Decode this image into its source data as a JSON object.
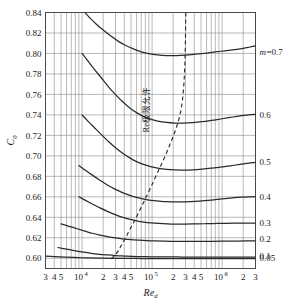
{
  "chart_data": {
    "type": "line",
    "title": "",
    "xlabel": "Re_d",
    "ylabel": "C_0",
    "xscale": "log",
    "xlim": [
      3000,
      3000000
    ],
    "ylim": [
      0.59,
      0.84
    ],
    "grid": true,
    "legend_position": "right-outside",
    "y_ticks": [
      0.6,
      0.62,
      0.64,
      0.66,
      0.68,
      0.7,
      0.72,
      0.74,
      0.76,
      0.78,
      0.8,
      0.82,
      0.84
    ],
    "y_tick_labels": [
      "0.60",
      "0.62",
      "0.64",
      "0.66",
      "0.68",
      "0.70",
      "0.72",
      "0.74",
      "0.76",
      "0.78",
      "0.80",
      "0.82",
      "0.84"
    ],
    "x_major_ticks": [
      10000,
      100000,
      1000000
    ],
    "x_major_tick_labels": [
      "10",
      "10",
      "10"
    ],
    "x_major_tick_exponents": [
      "4",
      "5",
      "6"
    ],
    "x_minor_ticks": [
      3000,
      4000,
      5000,
      20000,
      30000,
      40000,
      50000,
      200000,
      300000,
      400000,
      500000,
      2000000,
      3000000
    ],
    "x_minor_tick_labels": [
      "3",
      "4",
      "5",
      "2",
      "3",
      "4",
      "5",
      "2",
      "3",
      "4",
      "5",
      "2",
      "3"
    ],
    "legend_title": "m=0.7",
    "legend_entries": [
      "m=0.7",
      "0.6",
      "0.5",
      "0.4",
      "0.3",
      "0.2",
      "0.1",
      "0.05"
    ],
    "annotations": [
      {
        "text": "Re极限允许",
        "x": 90000,
        "y": 0.745,
        "rotation": -90
      }
    ],
    "series": [
      {
        "name": "m=0.7",
        "label": "m=0.7",
        "style": "solid",
        "label_value": 0.801,
        "points": [
          [
            11000,
            0.84
          ],
          [
            13000,
            0.8345
          ],
          [
            16000,
            0.8285
          ],
          [
            20000,
            0.8228
          ],
          [
            26000,
            0.8168
          ],
          [
            33000,
            0.8118
          ],
          [
            42000,
            0.8078
          ],
          [
            55000,
            0.8042
          ],
          [
            70000,
            0.8016
          ],
          [
            90000,
            0.7998
          ],
          [
            120000,
            0.7986
          ],
          [
            160000,
            0.798
          ],
          [
            220000,
            0.798
          ],
          [
            300000,
            0.7984
          ],
          [
            420000,
            0.7993
          ],
          [
            600000,
            0.8004
          ],
          [
            800000,
            0.8015
          ],
          [
            1100000,
            0.8026
          ],
          [
            1500000,
            0.8038
          ],
          [
            2000000,
            0.805
          ],
          [
            2500000,
            0.8063
          ],
          [
            3000000,
            0.8074
          ]
        ]
      },
      {
        "name": "m=0.6",
        "label": "0.6",
        "style": "solid",
        "label_value": 0.74,
        "points": [
          [
            10000,
            0.8
          ],
          [
            12000,
            0.793
          ],
          [
            15000,
            0.7845
          ],
          [
            19000,
            0.7758
          ],
          [
            24000,
            0.7672
          ],
          [
            30000,
            0.7598
          ],
          [
            38000,
            0.7528
          ],
          [
            48000,
            0.7468
          ],
          [
            60000,
            0.7422
          ],
          [
            75000,
            0.7386
          ],
          [
            95000,
            0.7358
          ],
          [
            120000,
            0.734
          ],
          [
            160000,
            0.7326
          ],
          [
            210000,
            0.732
          ],
          [
            280000,
            0.732
          ],
          [
            380000,
            0.7325
          ],
          [
            520000,
            0.7334
          ],
          [
            700000,
            0.7346
          ],
          [
            950000,
            0.736
          ],
          [
            1300000,
            0.7375
          ],
          [
            1800000,
            0.739
          ],
          [
            2400000,
            0.74
          ],
          [
            3000000,
            0.7406
          ]
        ]
      },
      {
        "name": "m=0.5",
        "label": "0.5",
        "style": "solid",
        "label_value": 0.694,
        "points": [
          [
            10000,
            0.74
          ],
          [
            12000,
            0.7342
          ],
          [
            15000,
            0.7275
          ],
          [
            19000,
            0.7205
          ],
          [
            24000,
            0.7138
          ],
          [
            30000,
            0.708
          ],
          [
            38000,
            0.7026
          ],
          [
            48000,
            0.698
          ],
          [
            60000,
            0.6944
          ],
          [
            75000,
            0.6916
          ],
          [
            95000,
            0.6895
          ],
          [
            120000,
            0.688
          ],
          [
            160000,
            0.6868
          ],
          [
            210000,
            0.6862
          ],
          [
            280000,
            0.6861
          ],
          [
            380000,
            0.6864
          ],
          [
            520000,
            0.6871
          ],
          [
            700000,
            0.688
          ],
          [
            950000,
            0.6891
          ],
          [
            1300000,
            0.6903
          ],
          [
            1800000,
            0.6916
          ],
          [
            2400000,
            0.6928
          ],
          [
            3000000,
            0.6936
          ]
        ]
      },
      {
        "name": "m=0.4",
        "label": "0.4",
        "style": "solid",
        "label_value": 0.66,
        "points": [
          [
            9000,
            0.6905
          ],
          [
            11000,
            0.6862
          ],
          [
            14000,
            0.6812
          ],
          [
            18000,
            0.6762
          ],
          [
            23000,
            0.6716
          ],
          [
            29000,
            0.6678
          ],
          [
            37000,
            0.6644
          ],
          [
            47000,
            0.6616
          ],
          [
            60000,
            0.6594
          ],
          [
            76000,
            0.6578
          ],
          [
            96000,
            0.6566
          ],
          [
            125000,
            0.6558
          ],
          [
            165000,
            0.6552
          ],
          [
            220000,
            0.655
          ],
          [
            300000,
            0.6551
          ],
          [
            410000,
            0.6555
          ],
          [
            560000,
            0.6562
          ],
          [
            760000,
            0.6571
          ],
          [
            1000000,
            0.658
          ],
          [
            1400000,
            0.6589
          ],
          [
            1900000,
            0.6596
          ],
          [
            2500000,
            0.66
          ],
          [
            3000000,
            0.6602
          ]
        ]
      },
      {
        "name": "m=0.3",
        "label": "0.3",
        "style": "solid",
        "label_value": 0.634,
        "points": [
          [
            9000,
            0.66
          ],
          [
            11000,
            0.6568
          ],
          [
            14000,
            0.653
          ],
          [
            18000,
            0.6492
          ],
          [
            23000,
            0.6458
          ],
          [
            29000,
            0.6428
          ],
          [
            37000,
            0.6402
          ],
          [
            47000,
            0.6382
          ],
          [
            60000,
            0.6366
          ],
          [
            76000,
            0.6354
          ],
          [
            96000,
            0.6346
          ],
          [
            125000,
            0.634
          ],
          [
            165000,
            0.6336
          ],
          [
            220000,
            0.6334
          ],
          [
            300000,
            0.6334
          ],
          [
            410000,
            0.6335
          ],
          [
            560000,
            0.6337
          ],
          [
            760000,
            0.6339
          ],
          [
            1000000,
            0.6341
          ],
          [
            1400000,
            0.6342
          ],
          [
            1900000,
            0.6343
          ],
          [
            2500000,
            0.6344
          ],
          [
            3000000,
            0.6344
          ]
        ]
      },
      {
        "name": "m=0.2",
        "label": "0.2",
        "style": "solid",
        "label_value": 0.619,
        "points": [
          [
            5000,
            0.6335
          ],
          [
            6500,
            0.6312
          ],
          [
            8500,
            0.6288
          ],
          [
            11000,
            0.6265
          ],
          [
            14000,
            0.6244
          ],
          [
            18000,
            0.6226
          ],
          [
            23000,
            0.6211
          ],
          [
            30000,
            0.6198
          ],
          [
            39000,
            0.6188
          ],
          [
            50000,
            0.6181
          ],
          [
            65000,
            0.6176
          ],
          [
            85000,
            0.6172
          ],
          [
            110000,
            0.6169
          ],
          [
            145000,
            0.6167
          ],
          [
            195000,
            0.6166
          ],
          [
            265000,
            0.6165
          ],
          [
            360000,
            0.6165
          ],
          [
            500000,
            0.6165
          ],
          [
            700000,
            0.6166
          ],
          [
            1000000,
            0.6167
          ],
          [
            1500000,
            0.6168
          ],
          [
            2200000,
            0.6169
          ],
          [
            3000000,
            0.617
          ]
        ]
      },
      {
        "name": "m=0.1",
        "label": "0.1",
        "style": "solid",
        "label_value": 0.602,
        "points": [
          [
            4500,
            0.6105
          ],
          [
            6000,
            0.6089
          ],
          [
            8000,
            0.6073
          ],
          [
            10500,
            0.6059
          ],
          [
            13500,
            0.6048
          ],
          [
            17500,
            0.6039
          ],
          [
            23000,
            0.6032
          ],
          [
            30000,
            0.6026
          ],
          [
            39000,
            0.6022
          ],
          [
            50000,
            0.6019
          ],
          [
            65000,
            0.6017
          ],
          [
            85000,
            0.6015
          ],
          [
            110000,
            0.6014
          ],
          [
            145000,
            0.6013
          ],
          [
            195000,
            0.6013
          ],
          [
            265000,
            0.6012
          ],
          [
            360000,
            0.6012
          ],
          [
            500000,
            0.6012
          ],
          [
            700000,
            0.6012
          ],
          [
            1000000,
            0.6012
          ],
          [
            1500000,
            0.6012
          ],
          [
            2200000,
            0.6012
          ],
          [
            3000000,
            0.6012
          ]
        ]
      },
      {
        "name": "m=0.05",
        "label": "0.05",
        "style": "solid",
        "label_value": 0.6,
        "points": [
          [
            3000,
            0.602
          ],
          [
            4000,
            0.6016
          ],
          [
            5500,
            0.6012
          ],
          [
            7500,
            0.6008
          ],
          [
            10000,
            0.6005
          ],
          [
            13500,
            0.6003
          ],
          [
            18000,
            0.6001
          ],
          [
            24000,
            0.6
          ],
          [
            32000,
            0.5999
          ],
          [
            43000,
            0.5998
          ],
          [
            58000,
            0.5998
          ],
          [
            78000,
            0.5997
          ],
          [
            105000,
            0.5997
          ],
          [
            140000,
            0.5997
          ],
          [
            190000,
            0.5997
          ],
          [
            260000,
            0.5997
          ],
          [
            360000,
            0.5997
          ],
          [
            500000,
            0.5997
          ],
          [
            700000,
            0.5997
          ],
          [
            1000000,
            0.5997
          ],
          [
            1500000,
            0.5997
          ],
          [
            2200000,
            0.5997
          ],
          [
            3000000,
            0.5997
          ]
        ]
      },
      {
        "name": "Re极限允许",
        "label": "Re极限允许",
        "style": "dashed",
        "points": [
          [
            26000,
            0.5995
          ],
          [
            30000,
            0.6035
          ],
          [
            34000,
            0.609
          ],
          [
            38000,
            0.615
          ],
          [
            43000,
            0.6215
          ],
          [
            48000,
            0.628
          ],
          [
            54000,
            0.6345
          ],
          [
            61000,
            0.6415
          ],
          [
            69000,
            0.649
          ],
          [
            78000,
            0.6565
          ],
          [
            88000,
            0.664
          ],
          [
            100000,
            0.672
          ],
          [
            113000,
            0.68
          ],
          [
            128000,
            0.688
          ],
          [
            145000,
            0.696
          ],
          [
            163000,
            0.704
          ],
          [
            182000,
            0.712
          ],
          [
            200000,
            0.719
          ],
          [
            218000,
            0.726
          ],
          [
            235000,
            0.733
          ],
          [
            250000,
            0.74
          ],
          [
            262000,
            0.747
          ],
          [
            272000,
            0.755
          ],
          [
            280000,
            0.764
          ],
          [
            287000,
            0.774
          ],
          [
            292000,
            0.785
          ],
          [
            296000,
            0.797
          ],
          [
            299000,
            0.81
          ],
          [
            301000,
            0.825
          ],
          [
            303000,
            0.84
          ]
        ]
      }
    ]
  },
  "axes": {
    "y_axis_title": "C",
    "y_axis_subscript": "0",
    "x_axis_title": "Re",
    "x_axis_subscript": "d"
  }
}
